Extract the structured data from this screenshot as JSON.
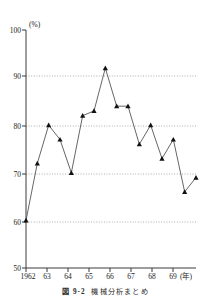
{
  "chart_data": {
    "type": "line",
    "title": "",
    "xlabel": "(年)",
    "ylabel": "(%)",
    "ylim": [
      50,
      100
    ],
    "xlim": [
      1962,
      1969.5
    ],
    "yticks": [
      50,
      60,
      70,
      80,
      90,
      100
    ],
    "ytick_labels": [
      "50",
      "60",
      "70",
      "80",
      "90",
      "100"
    ],
    "xticks": [
      1962,
      1963,
      1964,
      1965,
      1966,
      1967,
      1968,
      1969
    ],
    "xtick_labels": [
      "1962",
      "63",
      "64",
      "65",
      "66",
      "67",
      "68",
      "69"
    ],
    "grid": "horizontal-dotted-at-60-70-80-90",
    "legend": "none",
    "marker": "filled-triangle",
    "x": [
      1962.0,
      1962.5,
      1963.0,
      1963.5,
      1964.0,
      1964.5,
      1965.0,
      1965.5,
      1966.0,
      1966.5,
      1967.0,
      1967.5,
      1968.0,
      1968.5,
      1969.0,
      1969.5
    ],
    "values": [
      60,
      72,
      80,
      77,
      70,
      82,
      83,
      92,
      84,
      84,
      76,
      80,
      73,
      77,
      66,
      69
    ],
    "point_labels": [
      "1962",
      "",
      "63",
      "",
      "64",
      "",
      "65",
      "",
      "66",
      "",
      "67",
      "",
      "68",
      "",
      "69",
      ""
    ]
  },
  "axes": {
    "y_unit_label": "(%)",
    "x_unit_label": "(年)"
  },
  "caption": {
    "number": "図 9-2",
    "text": "機械分析まとめ"
  }
}
